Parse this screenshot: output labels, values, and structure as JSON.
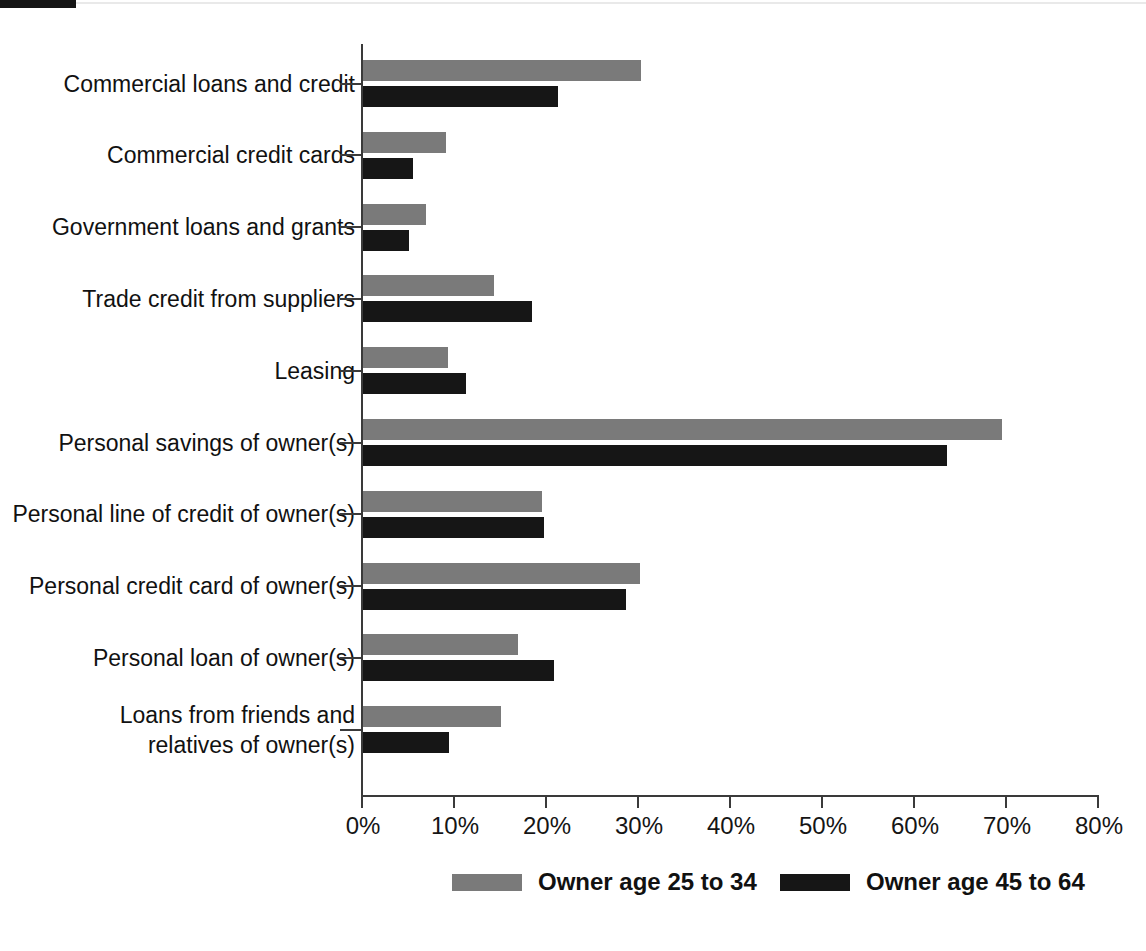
{
  "chart_data": {
    "type": "bar",
    "orientation": "horizontal",
    "title": "",
    "subtitle": "",
    "xlabel": "",
    "ylabel": "",
    "xlim": [
      0,
      80
    ],
    "xtick_labels": [
      "0%",
      "10%",
      "20%",
      "30%",
      "40%",
      "50%",
      "60%",
      "70%",
      "80%"
    ],
    "xtick_values": [
      0,
      10,
      20,
      30,
      40,
      50,
      60,
      70,
      80
    ],
    "grid": false,
    "legend_position": "bottom",
    "categories": [
      "Commercial loans and credit",
      "Commercial credit cards",
      "Government loans and grants",
      "Trade credit from suppliers",
      "Leasing",
      "Personal savings of owner(s)",
      "Personal line of credit of owner(s)",
      "Personal credit card of owner(s)",
      "Personal loan of owner(s)",
      "Loans from friends and\nrelatives of owner(s)"
    ],
    "series": [
      {
        "name": "Owner age 25 to 34",
        "color": "#7a7a7a",
        "values": [
          30.2,
          9.0,
          6.8,
          14.2,
          9.2,
          69.5,
          19.5,
          30.1,
          16.8,
          15.0
        ]
      },
      {
        "name": "Owner age 45 to 64",
        "color": "#161616",
        "values": [
          21.2,
          5.4,
          5.0,
          18.4,
          11.2,
          63.5,
          19.7,
          28.6,
          20.8,
          9.4
        ]
      }
    ]
  },
  "legend": {
    "items": [
      {
        "label": "Owner age 25 to 34",
        "color": "#7a7a7a"
      },
      {
        "label": "Owner age 45 to 64",
        "color": "#161616"
      }
    ]
  }
}
